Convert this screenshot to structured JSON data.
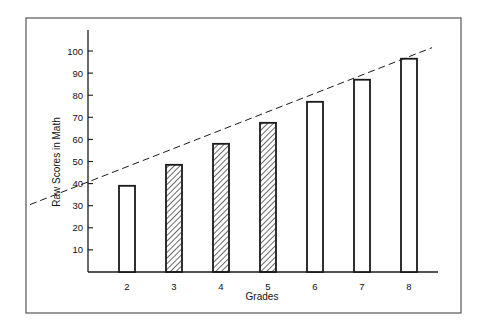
{
  "chart_data": {
    "type": "bar",
    "title": "",
    "xlabel": "Grades",
    "ylabel": "Raw Scores in Math",
    "categories": [
      "2",
      "3",
      "4",
      "5",
      "6",
      "7",
      "8"
    ],
    "values": [
      39,
      48.5,
      58,
      67.5,
      77,
      87,
      96.5
    ],
    "bar_fill": [
      "open",
      "hatched",
      "hatched",
      "hatched",
      "open",
      "open",
      "open"
    ],
    "y_ticks": [
      10,
      20,
      30,
      40,
      50,
      60,
      70,
      80,
      90,
      100
    ],
    "ylim": [
      0,
      105
    ],
    "grid": false,
    "legend": null,
    "trend_line": {
      "style": "dashed",
      "description": "linear trend through bar tops",
      "start": {
        "x_px": 30,
        "value": 30.5
      },
      "end": {
        "x_px": 432,
        "value": 101.5
      }
    }
  },
  "colors": {
    "ink": "#1a1a1a",
    "frame": "#555555",
    "background": "#ffffff"
  }
}
